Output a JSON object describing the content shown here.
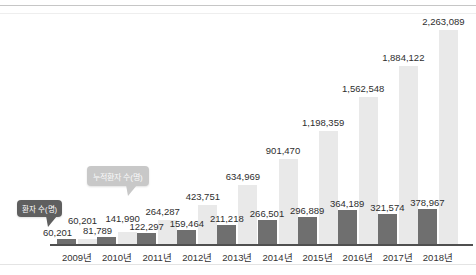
{
  "chart_data": {
    "type": "bar",
    "title": "",
    "categories": [
      "2009년",
      "2010년",
      "2011년",
      "2012년",
      "2013년",
      "2014년",
      "2015년",
      "2016년",
      "2017년",
      "2018년"
    ],
    "series": [
      {
        "name": "환자 수(명)",
        "values": [
          60201,
          81789,
          122297,
          159464,
          211218,
          266501,
          296889,
          364189,
          321574,
          378967
        ],
        "labels": [
          "60,201",
          "81,789",
          "122,297",
          "159,464",
          "211,218",
          "266,501",
          "296,889",
          "364,189",
          "321,574",
          "378,967"
        ]
      },
      {
        "name": "누적환자 수(명)",
        "values": [
          60201,
          141990,
          264287,
          423751,
          634969,
          901470,
          1198359,
          1562548,
          1884122,
          2263089
        ],
        "labels": [
          "60,201",
          "141,990",
          "264,287",
          "423,751",
          "634,969",
          "901,470",
          "1,198,359",
          "1,562,548",
          "1,884,122",
          "2,263,089"
        ]
      }
    ],
    "ylim": [
      0,
      2263089
    ],
    "grid": false,
    "legend_position": "callout-bubbles-left"
  },
  "callouts": {
    "annual": {
      "label": "환자 수(명)"
    },
    "cumulative": {
      "label": "누적환자 수(명)"
    }
  },
  "colors": {
    "annual_bar": "#6f6f6f",
    "cumulative_bar": "#e9e9e9",
    "axis": "#4f4f4f",
    "label_text": "#2e2e2e",
    "line_strong": "#c6c6c6",
    "annual_callout_bg": "#5f5f5f",
    "annual_callout_text": "#ffffff",
    "cumulative_callout_bg": "#c8c8c8",
    "cumulative_callout_text": "#fafafa"
  }
}
